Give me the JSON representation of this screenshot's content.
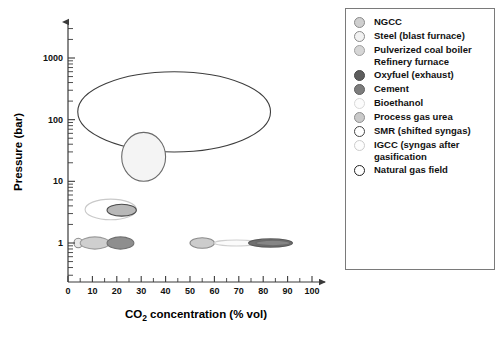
{
  "chart_data": {
    "type": "scatter",
    "title": "",
    "xlabel": "CO2 concentration (% vol)",
    "xlabel_main": "CO",
    "xlabel_sub": "2",
    "xlabel_rest": " concentration (% vol)",
    "ylabel": "Pressure (bar)",
    "xscale": "linear",
    "yscale": "log",
    "xlim": [
      0,
      100
    ],
    "ylim": [
      0.18,
      3000
    ],
    "xticks": [
      0,
      10,
      20,
      30,
      40,
      50,
      60,
      70,
      80,
      90,
      100
    ],
    "xtick_labels": [
      "0",
      "10",
      "20",
      "30",
      "40",
      "50",
      "60",
      "70",
      "80",
      "90",
      "100"
    ],
    "x_minor_step": 5,
    "yticks": [
      1,
      10,
      100,
      1000
    ],
    "ytick_labels": [
      "1",
      "10",
      "100",
      "1000"
    ],
    "grid": false,
    "axis_arrows": true,
    "legend_position": "right-outside",
    "series": [
      {
        "name": "Natural gas field",
        "shape": "ellipse",
        "x_range": [
          4,
          83
        ],
        "y_range": [
          30,
          600
        ],
        "x_center": 43.5,
        "y_center": 134,
        "fill": "none",
        "stroke": "#3d3d3d"
      },
      {
        "name": "SMR (shifted syngas)",
        "shape": "ellipse",
        "x_range": [
          22,
          40
        ],
        "y_range": [
          10,
          62
        ],
        "x_center": 31,
        "y_center": 25,
        "fill": "#f4f4f4",
        "stroke": "#6a6a6a"
      },
      {
        "name": "IGCC (syngas after gasification)",
        "shape": "ellipse",
        "x_range": [
          7,
          28
        ],
        "y_range": [
          2.4,
          5.2
        ],
        "x_center": 17.5,
        "y_center": 3.5,
        "fill": "none",
        "stroke": "#c9c9c9"
      },
      {
        "name": "Process gas urea",
        "shape": "ellipse",
        "x_range": [
          16,
          28
        ],
        "y_range": [
          2.7,
          4.2
        ],
        "x_center": 22,
        "y_center": 3.4,
        "fill": "#b8b8b8",
        "stroke": "#4a4a4a"
      },
      {
        "name": "Bioethanol",
        "shape": "ellipse",
        "x_range": [
          2.5,
          6
        ],
        "y_range": [
          0.84,
          1.2
        ],
        "x_center": 4.2,
        "y_center": 1.0,
        "fill": "#e8e8e8",
        "stroke": "#8a8a8a"
      },
      {
        "name": "NGCC",
        "shape": "ellipse",
        "x_range": [
          5,
          17
        ],
        "y_range": [
          0.8,
          1.26
        ],
        "x_center": 11,
        "y_center": 1.0,
        "fill": "#cfcfcf",
        "stroke": "#9a9a9a"
      },
      {
        "name": "Pulverized coal boiler / Refinery furnace",
        "shape": "ellipse",
        "x_range": [
          16,
          27
        ],
        "y_range": [
          0.8,
          1.26
        ],
        "x_center": 21.5,
        "y_center": 1.0,
        "fill": "#8e8e8e",
        "stroke": "#6f6f6f"
      },
      {
        "name": "Process gas urea (low pressure)",
        "shape": "ellipse",
        "x_range": [
          50,
          60
        ],
        "y_range": [
          0.82,
          1.22
        ],
        "x_center": 55,
        "y_center": 1.0,
        "fill": "#cccccc",
        "stroke": "#8a8a8a"
      },
      {
        "name": "Steel (blast furnace)",
        "shape": "ellipse",
        "x_range": [
          60,
          78
        ],
        "y_range": [
          0.9,
          1.12
        ],
        "x_center": 69,
        "y_center": 1.0,
        "fill": "#fbfbfb",
        "stroke": "#cfcfcf"
      },
      {
        "name": "Oxyfuel (exhaust)",
        "shape": "ellipse",
        "x_range": [
          74,
          92
        ],
        "y_range": [
          0.86,
          1.17
        ],
        "x_center": 83,
        "y_center": 1.0,
        "fill": "#707070",
        "stroke": "#5a5a5a"
      },
      {
        "name": "Cement",
        "shape": "ellipse",
        "x_range": [
          77,
          91
        ],
        "y_range": [
          0.9,
          1.1
        ],
        "x_center": 84,
        "y_center": 1.0,
        "fill": "#858585",
        "stroke": "#6a6a6a"
      }
    ]
  },
  "legend": {
    "items": [
      {
        "label": "NGCC",
        "label2": "",
        "color": "#cfcfcf",
        "border": "#8a8a8a"
      },
      {
        "label": "Steel (blast furnace)",
        "label2": "",
        "color": "#f2f2f2",
        "border": "#8a8a8a"
      },
      {
        "label": "Pulverized coal boiler",
        "label2": "Refinery furnace",
        "color": "#d6d6d6",
        "border": "#a0a0a0"
      },
      {
        "label": "Oxyfuel (exhaust)",
        "label2": "",
        "color": "#5e5e5e",
        "border": "#4a4a4a"
      },
      {
        "label": "Cement",
        "label2": "",
        "color": "#7d7d7d",
        "border": "#5f5f5f"
      },
      {
        "label": "Bioethanol",
        "label2": "",
        "color": "#fcfcfc",
        "border": "#d8d8d8"
      },
      {
        "label": "Process gas urea",
        "label2": "",
        "color": "#cacaca",
        "border": "#8e8e8e"
      },
      {
        "label": "SMR (shifted syngas)",
        "label2": "",
        "color": "#ffffff",
        "border": "#444444"
      },
      {
        "label": "IGCC (syngas after",
        "label2": "gasification",
        "color": "#fdfdfd",
        "border": "#cccccc"
      },
      {
        "label": "Natural gas field",
        "label2": "",
        "color": "#ffffff",
        "border": "#222222"
      }
    ]
  }
}
